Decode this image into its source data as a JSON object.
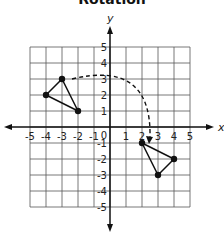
{
  "title": "Rotation",
  "axes": {
    "x_label": "x",
    "y_label": "y",
    "x_ticks": [
      "-5",
      "-4",
      "-3",
      "-2",
      "-1",
      "1",
      "2",
      "3",
      "4",
      "5"
    ],
    "y_ticks": [
      "5",
      "4",
      "3",
      "2",
      "1",
      "-1",
      "-2",
      "-3",
      "-4",
      "-5"
    ],
    "origin_label": "0",
    "range": [
      -5,
      5
    ]
  },
  "preimage": {
    "name": "original triangle",
    "vertices": [
      [
        -4,
        2
      ],
      [
        -3,
        3
      ],
      [
        -2,
        1
      ]
    ]
  },
  "image": {
    "name": "rotated triangle",
    "vertices": [
      [
        2,
        -1
      ],
      [
        4,
        -2
      ],
      [
        3,
        -3
      ]
    ]
  },
  "rotation_arrow": {
    "from": [
      -3,
      3
    ],
    "to": [
      2.5,
      -1
    ],
    "style": "dashed",
    "direction": "clockwise"
  }
}
